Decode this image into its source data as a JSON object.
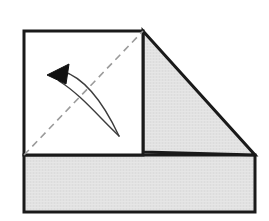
{
  "figure": {
    "title": "Paper folding diagram",
    "canvas": {
      "width": 269,
      "height": 221,
      "background": "#ffffff"
    },
    "colors": {
      "outline": "#1a1a1a",
      "paper_front": "#ffffff",
      "paper_shaded": "#e2e2e2",
      "crease_dash": "#9a9a9a",
      "arrow_stroke": "#3c3c3c",
      "arrow_head_fill": "#111111"
    },
    "stroke_widths": {
      "outline": 3,
      "crease": 1.6,
      "arrow": 1.4
    },
    "shapes": [
      {
        "name": "base-strip",
        "kind": "polygon",
        "label": "Shaded base strip (bottom)",
        "fill": "#e2e2e2",
        "stroke": "#1a1a1a",
        "points": "24,155 255,155 255,212 24,212"
      },
      {
        "name": "folded-flap",
        "kind": "polygon",
        "label": "Folded triangular flap (shaded underside)",
        "fill": "#e2e2e2",
        "stroke": "#1a1a1a",
        "points": "143,31 255,155 143,152"
      },
      {
        "name": "front-panel",
        "kind": "polygon",
        "label": "White front panel of the sheet",
        "fill": "#ffffff",
        "stroke": "#1a1a1a",
        "points": "24,31 143,31 143,155 24,155"
      }
    ],
    "crease": {
      "name": "diagonal-crease-line",
      "label": "Dashed diagonal fold crease",
      "from": {
        "x": 24,
        "y": 155
      },
      "to": {
        "x": 143,
        "y": 31
      },
      "dash_pattern": "7 5"
    },
    "arrow": {
      "name": "fold-direction-arrow",
      "label": "Curved arrow showing fold direction",
      "upper_arc": "M 119,136 C 104,104 86,78 62,71",
      "lower_arc": "M 119,136 C 98,116 80,94 59,81",
      "head": {
        "label": "Arrowhead pointing upper-left",
        "points": "47,75 69,64 66,84",
        "fill": "#111111"
      }
    }
  }
}
